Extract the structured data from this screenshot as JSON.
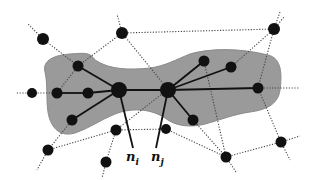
{
  "diagram": {
    "title": "",
    "colors": {
      "background": "#ffffff",
      "region_fill": "#9a9a9a",
      "region_stroke": "#8a8a8a",
      "node": "#111111",
      "solid_edge": "#111111",
      "dotted_edge": "#444444"
    },
    "region_path": "M 45 72 C 42 60 55 55 70 54 C 85 53 90 52 95 60 C 110 70 130 70 150 68 C 165 66 175 60 190 54 C 210 48 240 48 268 55 C 282 58 282 75 280 90 C 278 105 265 110 250 112 C 235 114 220 120 205 124 C 190 128 175 126 165 118 C 150 108 130 108 115 114 C 100 120 90 128 75 133 C 58 138 50 125 48 112 C 46 100 48 85 45 72 Z",
    "nodes": [
      {
        "id": "a",
        "x": 43,
        "y": 39,
        "r": 6
      },
      {
        "id": "b",
        "x": 122,
        "y": 33,
        "r": 6
      },
      {
        "id": "c",
        "x": 274,
        "y": 29,
        "r": 6
      },
      {
        "id": "d",
        "x": 32,
        "y": 93,
        "r": 5
      },
      {
        "id": "e",
        "x": 78,
        "y": 66,
        "r": 5.5
      },
      {
        "id": "f",
        "x": 57,
        "y": 93,
        "r": 5.5
      },
      {
        "id": "g",
        "x": 88,
        "y": 93,
        "r": 5.5
      },
      {
        "id": "h",
        "x": 72,
        "y": 120,
        "r": 5.5
      },
      {
        "id": "ni",
        "x": 119,
        "y": 90,
        "r": 8
      },
      {
        "id": "nj",
        "x": 168,
        "y": 90,
        "r": 8
      },
      {
        "id": "k",
        "x": 204,
        "y": 61,
        "r": 5.5
      },
      {
        "id": "l",
        "x": 231,
        "y": 67,
        "r": 5.5
      },
      {
        "id": "m",
        "x": 193,
        "y": 120,
        "r": 5.5
      },
      {
        "id": "o",
        "x": 258,
        "y": 88,
        "r": 5.5
      },
      {
        "id": "p",
        "x": 48,
        "y": 150,
        "r": 5.5
      },
      {
        "id": "q",
        "x": 116,
        "y": 130,
        "r": 5.5
      },
      {
        "id": "s",
        "x": 106,
        "y": 162,
        "r": 5.5
      },
      {
        "id": "t",
        "x": 226,
        "y": 157,
        "r": 5.5
      },
      {
        "id": "u",
        "x": 281,
        "y": 142,
        "r": 5.5
      },
      {
        "id": "v",
        "x": 166,
        "y": 129,
        "r": 5
      }
    ],
    "solid_edges": [
      [
        "e",
        "ni"
      ],
      [
        "f",
        "g"
      ],
      [
        "g",
        "ni"
      ],
      [
        "h",
        "ni"
      ],
      [
        "ni",
        "nj"
      ],
      [
        "nj",
        "k"
      ],
      [
        "nj",
        "l"
      ],
      [
        "nj",
        "m"
      ],
      [
        "nj",
        "o"
      ],
      [
        "ni",
        "lab_i"
      ],
      [
        "nj",
        "lab_j"
      ]
    ],
    "label_anchors": [
      {
        "id": "lab_i",
        "x": 133,
        "y": 148
      },
      {
        "id": "lab_j",
        "x": 156,
        "y": 148
      }
    ],
    "dotted_edges": [
      [
        "a",
        "e"
      ],
      [
        "a",
        "lead_a"
      ],
      [
        "b",
        "e"
      ],
      [
        "b",
        "c"
      ],
      [
        "b",
        "lead_b"
      ],
      [
        "b",
        "m"
      ],
      [
        "c",
        "l"
      ],
      [
        "c",
        "o"
      ],
      [
        "c",
        "lead_c1"
      ],
      [
        "c",
        "lead_c2"
      ],
      [
        "d",
        "f"
      ],
      [
        "d",
        "lead_d"
      ],
      [
        "e",
        "f"
      ],
      [
        "h",
        "p"
      ],
      [
        "p",
        "q"
      ],
      [
        "p",
        "lead_p"
      ],
      [
        "q",
        "s"
      ],
      [
        "q",
        "v"
      ],
      [
        "q",
        "k"
      ],
      [
        "s",
        "lead_s"
      ],
      [
        "v",
        "t"
      ],
      [
        "k",
        "t"
      ],
      [
        "m",
        "t"
      ],
      [
        "t",
        "u"
      ],
      [
        "t",
        "lead_t"
      ],
      [
        "u",
        "o"
      ],
      [
        "u",
        "lead_u1"
      ],
      [
        "u",
        "lead_u2"
      ],
      [
        "o",
        "lead_o"
      ]
    ],
    "lead_points": [
      {
        "id": "lead_a",
        "x": 28,
        "y": 24
      },
      {
        "id": "lead_b",
        "x": 117,
        "y": 14
      },
      {
        "id": "lead_c1",
        "x": 280,
        "y": 12
      },
      {
        "id": "lead_c2",
        "x": 284,
        "y": 17
      },
      {
        "id": "lead_d",
        "x": 16,
        "y": 93
      },
      {
        "id": "lead_p",
        "x": 37,
        "y": 170
      },
      {
        "id": "lead_s",
        "x": 102,
        "y": 178
      },
      {
        "id": "lead_t",
        "x": 236,
        "y": 172
      },
      {
        "id": "lead_u1",
        "x": 300,
        "y": 136
      },
      {
        "id": "lead_u2",
        "x": 290,
        "y": 160
      },
      {
        "id": "lead_o",
        "x": 300,
        "y": 88
      }
    ],
    "labels": [
      {
        "id": "label_ni",
        "base": "n",
        "sub": "i",
        "x": 126,
        "y": 148
      },
      {
        "id": "label_nj",
        "base": "n",
        "sub": "j",
        "x": 151,
        "y": 148
      }
    ]
  }
}
